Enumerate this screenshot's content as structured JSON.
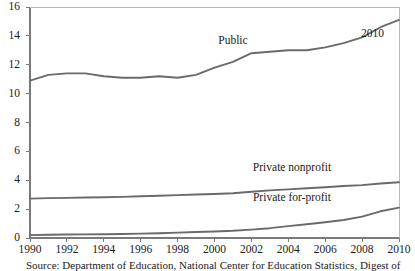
{
  "chart_data": {
    "type": "line",
    "title": "",
    "subtitle": "",
    "xlabel": "",
    "ylabel": "",
    "xlim": [
      1990,
      2010
    ],
    "ylim": [
      0,
      16
    ],
    "grid": false,
    "legend_position": "inline-annotations",
    "x": [
      1990,
      1991,
      1992,
      1993,
      1994,
      1995,
      1996,
      1997,
      1998,
      1999,
      2000,
      2001,
      2002,
      2003,
      2004,
      2005,
      2006,
      2007,
      2008,
      2009,
      2010
    ],
    "xticks": [
      "1990",
      "1992",
      "1994",
      "1996",
      "1998",
      "2000",
      "2002",
      "2004",
      "2006",
      "2008",
      "2010"
    ],
    "xtick_values": [
      1990,
      1992,
      1994,
      1996,
      1998,
      2000,
      2002,
      2004,
      2006,
      2008,
      2010
    ],
    "yticks": [
      "0",
      "2",
      "4",
      "6",
      "8",
      "10",
      "12",
      "14",
      "16"
    ],
    "ytick_values": [
      0,
      2,
      4,
      6,
      8,
      10,
      12,
      14,
      16
    ],
    "line_color": "#6a6a6a",
    "axis_color": "#7a7a7a",
    "series": [
      {
        "name": "Public",
        "label": "Public",
        "values": [
          10.9,
          11.3,
          11.4,
          11.4,
          11.2,
          11.1,
          11.1,
          11.2,
          11.1,
          11.3,
          11.8,
          12.2,
          12.8,
          12.9,
          13.0,
          13.0,
          13.2,
          13.5,
          13.9,
          14.6,
          15.1
        ]
      },
      {
        "name": "Private nonprofit",
        "label": "Private nonprofit",
        "values": [
          2.73,
          2.76,
          2.78,
          2.8,
          2.82,
          2.85,
          2.89,
          2.93,
          2.97,
          3.01,
          3.05,
          3.1,
          3.2,
          3.3,
          3.37,
          3.45,
          3.52,
          3.6,
          3.66,
          3.77,
          3.86
        ]
      },
      {
        "name": "Private for-profit",
        "label": "Private for-profit",
        "values": [
          0.2,
          0.22,
          0.24,
          0.25,
          0.26,
          0.28,
          0.3,
          0.33,
          0.37,
          0.42,
          0.45,
          0.5,
          0.58,
          0.68,
          0.82,
          0.95,
          1.09,
          1.25,
          1.48,
          1.85,
          2.1
        ]
      }
    ],
    "annotations": [
      {
        "text": "Public",
        "x": 2001,
        "y": 13.7
      },
      {
        "text": "Private nonprofit",
        "x": 2004.2,
        "y": 4.9
      },
      {
        "text": "Private for-profit",
        "x": 2004.2,
        "y": 2.85
      },
      {
        "text": "2010",
        "x": 2010.3,
        "y": 14.2
      }
    ]
  },
  "labels": {
    "public": "Public",
    "private_nonprofit": "Private nonprofit",
    "private_forprofit": "Private for-profit",
    "endpoint_2010": "2010"
  },
  "source": {
    "note": "Source: Department of Education, National Center for Education Statistics, Digest of"
  }
}
